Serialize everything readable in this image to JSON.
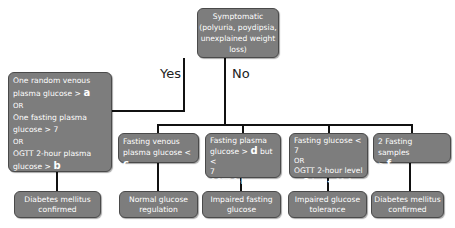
{
  "diagram": {
    "root": {
      "lines": [
        "Symptomatic",
        "(polyuria, poydipsia,",
        "unexplained weight loss)"
      ]
    },
    "branch_labels": {
      "yes": "Yes",
      "no": "No"
    },
    "yes_criteria": {
      "line1": "One random venous",
      "line2_prefix": "plasma glucose > ",
      "var_a": "a",
      "or1": "OR",
      "line3": "One fasting plasma",
      "line4": "glucose > 7",
      "or2": "OR",
      "line5": "OGTT 2-hour plasma",
      "line6_prefix": "glucose > ",
      "var_b": "b"
    },
    "yes_outcome": {
      "lines": [
        "Diabetes mellitus",
        "confirmed"
      ]
    },
    "no_criteria": [
      {
        "line1": "Fasting venous",
        "line2_prefix": "plasma glucose < ",
        "var": "c"
      },
      {
        "line1": "Fasting plasma",
        "line2_prefix": "glucose > ",
        "var": "d",
        "line2_suffix": " but <",
        "line3": "7",
        "line4": "OGTT 2-hour level"
      },
      {
        "line1": "Fasting glucose < 7",
        "or": "OR",
        "line2": "OGTT 2-hour level",
        "line3_prefix": "> ",
        "var": "e",
        "line3_suffix": " but < 11.1"
      },
      {
        "line1": "2 Fasting samples",
        "line2_prefix": "> ",
        "var": "f"
      }
    ],
    "no_outcomes": [
      {
        "lines": [
          "Normal glucose",
          "regulation"
        ]
      },
      {
        "lines": [
          "Impaired fasting",
          "glucose"
        ]
      },
      {
        "lines": [
          "Impaired glucose",
          "tolerance"
        ]
      },
      {
        "lines": [
          "Diabetes mellitus",
          "confirmed"
        ]
      }
    ],
    "colors": {
      "box_fill": "#7d7d7d",
      "box_border": "#4a4a4a",
      "text": "#ffffff",
      "connector": "#111111"
    }
  }
}
